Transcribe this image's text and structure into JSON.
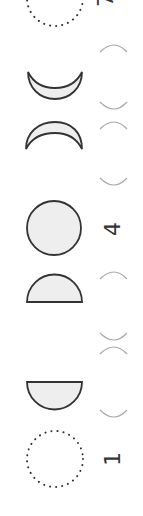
{
  "diagram": {
    "labels": {
      "top": "7",
      "middle": "4",
      "bottom": "1"
    },
    "phases": [
      {
        "name": "new-moon-top",
        "shape": "dotted-circle"
      },
      {
        "name": "crescent-lower",
        "shape": "crescent-down"
      },
      {
        "name": "crescent-upper",
        "shape": "crescent-up"
      },
      {
        "name": "full-moon",
        "shape": "circle"
      },
      {
        "name": "half-moon-upper",
        "shape": "half-up"
      },
      {
        "name": "half-moon-lower",
        "shape": "half-down"
      },
      {
        "name": "new-moon-bottom",
        "shape": "dotted-circle"
      }
    ],
    "colors": {
      "fill": "#eeeeee",
      "stroke": "#333333",
      "faint": "#aaaaaa"
    }
  }
}
